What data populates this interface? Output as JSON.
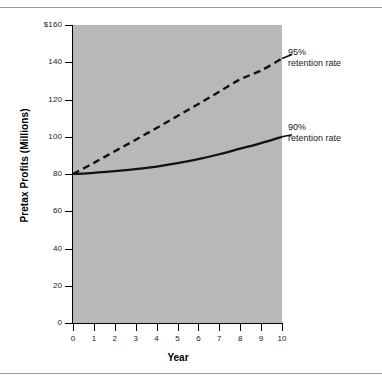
{
  "chart_data": {
    "type": "line",
    "title": "",
    "subtitle": "",
    "xlabel": "Year",
    "ylabel": "Pretax Profits (Millions)",
    "xlim": [
      0,
      10
    ],
    "ylim": [
      0,
      160
    ],
    "x": [
      0,
      1,
      2,
      3,
      4,
      5,
      6,
      7,
      8,
      9,
      10
    ],
    "x_tick_labels": [
      "0",
      "1",
      "2",
      "3",
      "4",
      "5",
      "6",
      "7",
      "8",
      "9",
      "10"
    ],
    "y_ticks": [
      0,
      20,
      40,
      60,
      80,
      100,
      120,
      140,
      160
    ],
    "y_tick_labels": [
      "0",
      "20",
      "40",
      "60",
      "80",
      "100",
      "120",
      "140",
      "$160"
    ],
    "grid": false,
    "legend_position": "inline-annotations",
    "plot_background": "#b8b8b8",
    "series": [
      {
        "name": "95% retention rate",
        "style": "dashed",
        "color": "#111111",
        "values": [
          80,
          86,
          92.2,
          98.4,
          104.7,
          111.1,
          117.6,
          124.2,
          130.8,
          135.6,
          142
        ]
      },
      {
        "name": "90% retention rate",
        "style": "solid",
        "color": "#111111",
        "values": [
          80,
          80.6,
          81.5,
          82.6,
          84,
          85.8,
          88,
          90.6,
          93.6,
          96.6,
          100
        ]
      }
    ],
    "annotations": [
      {
        "id": "ann-95",
        "text": "95%\nretention rate",
        "series": "95% retention rate"
      },
      {
        "id": "ann-90",
        "text": "90%\nretention rate",
        "series": "90% retention rate"
      }
    ]
  }
}
